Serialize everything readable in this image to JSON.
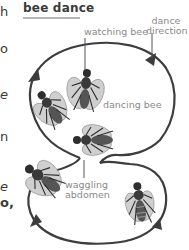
{
  "title": "bee dance",
  "left_text_fragments": [
    {
      "text": "h",
      "top": 5,
      "style": "normal"
    },
    {
      "text": "o",
      "top": 42,
      "style": "normal"
    },
    {
      "text": "e",
      "top": 88,
      "style": "italic"
    },
    {
      "text": "n",
      "top": 130,
      "style": "normal"
    },
    {
      "text": "e",
      "top": 180,
      "style": "italic"
    },
    {
      "text": "o,",
      "top": 196,
      "style": "bold"
    }
  ],
  "labels": {
    "watching_bee": "watching bee",
    "dance_direction_line1": "dance",
    "dance_direction_line2": "direction",
    "dancing_bee": "dancing bee",
    "waggling_line1": "waggling",
    "waggling_line2": "abdomen"
  },
  "colors": {
    "path": "#3d3d3d",
    "label": "#8a8a8a",
    "title_rule": "#b5b5b5",
    "bee_body": "#2e2e2e",
    "bee_wing": "#c9c9c9"
  },
  "icons": {
    "bees": [
      "watching-bee-icon",
      "left-bee-icon",
      "dancing-bee-icon",
      "lower-left-bee-icon",
      "lower-right-bee-icon"
    ],
    "arrows": [
      "arrow-top-left-icon",
      "arrow-top-right-icon",
      "arrow-bottom-left-icon",
      "arrow-bottom-right-icon"
    ]
  }
}
